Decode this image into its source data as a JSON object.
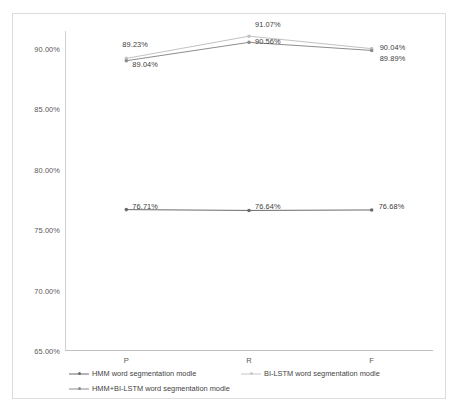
{
  "chart_data": {
    "type": "line",
    "title": "",
    "xlabel": "",
    "ylabel": "",
    "categories": [
      "P",
      "R",
      "F"
    ],
    "ylim": [
      65.0,
      91.5
    ],
    "yticks": [
      "65.00%",
      "70.00%",
      "75.00%",
      "80.00%",
      "85.00%",
      "90.00%"
    ],
    "ytick_values": [
      65.0,
      70.0,
      75.0,
      80.0,
      85.0,
      90.0
    ],
    "grid": false,
    "legend_position": "bottom",
    "series": [
      {
        "name": "HMM word segmentation modle",
        "color": "#6b6b6b",
        "values": [
          76.71,
          76.64,
          76.68
        ],
        "labels": [
          "76.71%",
          "76.64%",
          "76.68%"
        ]
      },
      {
        "name": "BI-LSTM word segmentation modle",
        "color": "#c2c2c2",
        "values": [
          89.23,
          91.07,
          90.04
        ],
        "labels": [
          "89.23%",
          "91.07%",
          "90.04%"
        ]
      },
      {
        "name": "HMM+BI-LSTM word segmentation modle",
        "color": "#8d8d8d",
        "values": [
          89.04,
          90.56,
          89.89
        ],
        "labels": [
          "89.04%",
          "90.56%",
          "89.89%"
        ]
      }
    ]
  },
  "legend": {
    "items": [
      "HMM word segmentation modle",
      "BI-LSTM word segmentation modle",
      "HMM+BI-LSTM word segmentation modle"
    ]
  }
}
